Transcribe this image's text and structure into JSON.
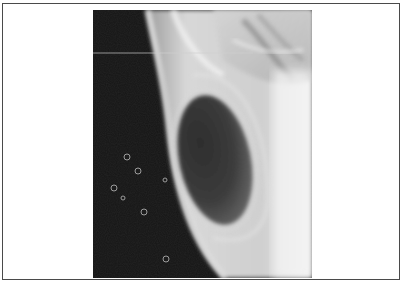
{
  "figure": {
    "type": "radiograph",
    "caption": "",
    "colors": {
      "frame_border": "#4a4a4a",
      "background": "#ffffff",
      "film_dark": "#121212",
      "soft_tissue": "#cfcfcf",
      "bone_bright": "#f2f2f2",
      "gas_lucency": "#3a3a3a"
    },
    "image": {
      "x": 93,
      "y": 10,
      "width": 219,
      "height": 268,
      "features": [
        {
          "name": "dark-background-air",
          "region": "left"
        },
        {
          "name": "oval-lucency",
          "cx": 122,
          "cy": 152,
          "rx": 36,
          "ry": 66
        },
        {
          "name": "bright-soft-tissue",
          "region": "right"
        },
        {
          "name": "horizontal-scan-line",
          "y": 43
        },
        {
          "name": "ring-artifacts",
          "count": 7
        }
      ]
    }
  }
}
